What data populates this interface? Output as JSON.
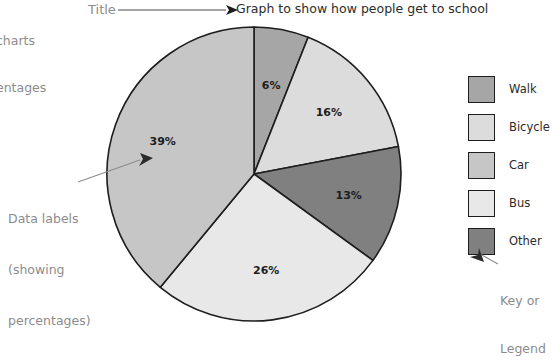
{
  "page": {
    "corner_note_line1": "charts",
    "corner_note_line2": "entages"
  },
  "annotations": {
    "title_callout": "Title",
    "data_labels_line1": "Data labels",
    "data_labels_line2": "(showing",
    "data_labels_line3": "percentages)",
    "key_line1": "Key or",
    "key_line2": "Legend"
  },
  "legend": {
    "position": "right",
    "items": [
      {
        "label": "Walk",
        "color": "#a6a6a6"
      },
      {
        "label": "Bicycle",
        "color": "#dcdcdc"
      },
      {
        "label": "Car",
        "color": "#c6c6c6"
      },
      {
        "label": "Bus",
        "color": "#e8e8e8"
      },
      {
        "label": "Other",
        "color": "#808080"
      }
    ]
  },
  "chart_data": {
    "type": "pie",
    "title": "Graph to show how people get to school",
    "xlabel": "",
    "ylabel": "",
    "units": "percent",
    "start_angle_deg": 0,
    "direction": "clockwise",
    "categories": [
      "Walk",
      "Bicycle",
      "Other",
      "Bus",
      "Car"
    ],
    "values": [
      6,
      16,
      13,
      26,
      39
    ],
    "labels": [
      "6%",
      "16%",
      "13%",
      "26%",
      "39%"
    ],
    "slice_colors": [
      "#a6a6a6",
      "#dcdcdc",
      "#808080",
      "#e8e8e8",
      "#c6c6c6"
    ],
    "legend_order": [
      "Walk",
      "Bicycle",
      "Car",
      "Bus",
      "Other"
    ],
    "total": 100,
    "grid": false
  }
}
